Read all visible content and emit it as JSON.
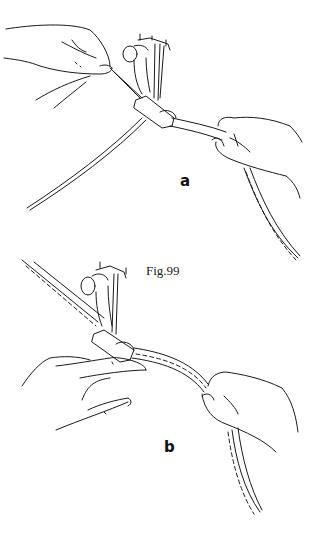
{
  "figure": {
    "caption": "Fig.99",
    "panels": [
      {
        "label": "a",
        "description": "Holding thread ends while starting a seam under the presser foot"
      },
      {
        "label": "b",
        "description": "Guiding the fabric strip through the presser foot with both hands"
      }
    ],
    "colors": {
      "ink": "#1a1a1a",
      "background": "#ffffff"
    }
  }
}
